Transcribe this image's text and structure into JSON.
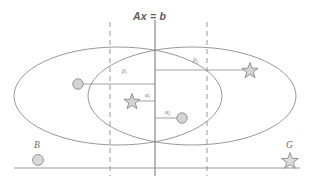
{
  "figure": {
    "title": "Ax = b",
    "width": 314,
    "height": 186,
    "background": "#ffffff"
  },
  "colors": {
    "stroke": "#8c8c8c",
    "marker_fill": "#d0d0d0",
    "marker_stroke": "#8a8a8a",
    "text": "#6e6e6e",
    "baseline": "#9a9a9a"
  },
  "annotations": {
    "hyperplane_label": "Ax = b",
    "beta_i": "β",
    "beta_i_sub": "i",
    "beta_j": "β",
    "beta_j_sub": "j",
    "alpha_i": "α",
    "alpha_i_sub": "i",
    "alpha_j": "α",
    "alpha_j_sub": "j",
    "class_b": "B",
    "class_g": "G"
  },
  "legend": {
    "b_label": "B",
    "b_marker": "circle",
    "g_label": "G",
    "g_marker": "star"
  },
  "geometry": {
    "center_line_x": 155,
    "dashed_left_x": 110,
    "dashed_right_x": 207,
    "baseline_y": 168,
    "ellipse_left": {
      "cx": 118,
      "cy": 96,
      "rx": 104,
      "ry": 49
    },
    "ellipse_right": {
      "cx": 192,
      "cy": 96,
      "rx": 104,
      "ry": 49
    },
    "markers": [
      {
        "name": "circle-left",
        "type": "circle",
        "x": 78,
        "y": 84
      },
      {
        "name": "star-inner",
        "type": "star",
        "x": 132,
        "y": 101
      },
      {
        "name": "circle-inner",
        "type": "circle",
        "x": 182,
        "y": 118
      },
      {
        "name": "star-right",
        "type": "star",
        "x": 250,
        "y": 70
      },
      {
        "name": "legend-circle",
        "type": "circle",
        "x": 38,
        "y": 160
      },
      {
        "name": "legend-star",
        "type": "star",
        "x": 290,
        "y": 160
      }
    ],
    "leader_lines": [
      {
        "name": "beta-i-leader",
        "x1": 78,
        "x2": 155,
        "y": 84
      },
      {
        "name": "beta-j-leader",
        "x1": 155,
        "x2": 250,
        "y": 70
      },
      {
        "name": "alpha-i-leader",
        "x1": 132,
        "x2": 155,
        "y": 101
      },
      {
        "name": "alpha-j-leader",
        "x1": 155,
        "x2": 182,
        "y": 118
      }
    ]
  }
}
